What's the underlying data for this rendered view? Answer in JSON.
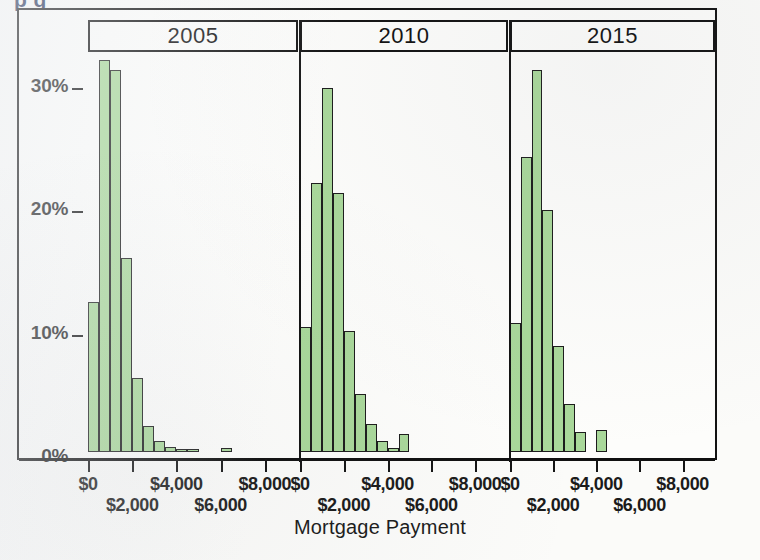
{
  "ghost_title": "p           g",
  "axes": {
    "y_ticks": [
      "0%",
      "10%",
      "20%",
      "30%"
    ],
    "x_title": "Mortgage Payment",
    "x_ticks_top": [
      "$0",
      "$4,000",
      "$8,000"
    ],
    "x_ticks_bottom": [
      "$2,000",
      "$6,000"
    ]
  },
  "colors": {
    "bar_fill": "#a9d89a",
    "bar_stroke": "#1c1c1c",
    "frame": "#121212",
    "paper": "#fdfdfb"
  },
  "panels": [
    {
      "label": "2005"
    },
    {
      "label": "2010"
    },
    {
      "label": "2015"
    }
  ],
  "chart_data": {
    "type": "bar",
    "subtitle": "Trellis histogram, three panels",
    "xlabel": "Mortgage Payment",
    "ylabel": "Percent",
    "ylim": [
      0,
      33
    ],
    "xlim": [
      0,
      9500
    ],
    "y_tick_labels": [
      "0%",
      "10%",
      "20%",
      "30%"
    ],
    "y_tick_values": [
      0,
      10,
      20,
      30
    ],
    "x_tick_labels": [
      "$0",
      "$2,000",
      "$4,000",
      "$6,000",
      "$8,000"
    ],
    "x_tick_values": [
      0,
      2000,
      4000,
      6000,
      8000
    ],
    "bin_width": 500,
    "grid": false,
    "legend": "none",
    "panel_variable": "Year",
    "series": [
      {
        "name": "2005",
        "panel": "2005",
        "bin_starts": [
          0,
          500,
          1000,
          1500,
          2000,
          2500,
          3000,
          3500,
          4000,
          4500,
          5000,
          6000
        ],
        "values": [
          12.2,
          31.8,
          31.0,
          15.7,
          6.0,
          2.1,
          0.9,
          0.4,
          0.25,
          0.2,
          0.0,
          0.3
        ]
      },
      {
        "name": "2010",
        "panel": "2010",
        "bin_starts": [
          0,
          500,
          1000,
          1500,
          2000,
          2500,
          3000,
          3500,
          4000,
          4500,
          5000
        ],
        "values": [
          10.1,
          21.8,
          29.5,
          21.0,
          9.8,
          4.7,
          2.3,
          0.9,
          0.3,
          1.5,
          0.0
        ]
      },
      {
        "name": "2015",
        "panel": "2015",
        "bin_starts": [
          0,
          500,
          1000,
          1500,
          2000,
          2500,
          3000,
          3500,
          4000,
          4500,
          5000
        ],
        "values": [
          10.5,
          23.9,
          31.0,
          19.6,
          8.6,
          3.9,
          1.6,
          0.0,
          1.8,
          0.0,
          0.0
        ]
      }
    ]
  }
}
